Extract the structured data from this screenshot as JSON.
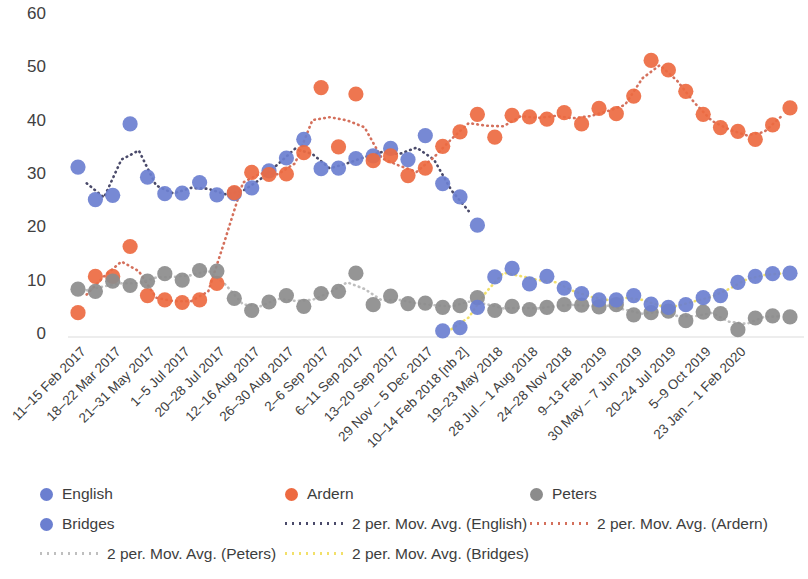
{
  "chart_data": {
    "type": "scatter",
    "title": "",
    "xlabel": "",
    "ylabel": "",
    "ylim": [
      0,
      60
    ],
    "ytick_values": [
      0,
      10,
      20,
      30,
      40,
      50,
      60
    ],
    "grid": false,
    "legend_position": "bottom",
    "categories": [
      "11–15 Feb 2017",
      "18–22 Mar 2017",
      "21–31 May 2017",
      "1–5 Jul 2017",
      "20–28 Jul 2017",
      "12–16 Aug 2017",
      "26–30 Aug 2017",
      "2–6 Sep 2017",
      "6–11 Sep 2017",
      "13–20 Sep 2017",
      "29 Nov – 5 Dec 2017",
      "10–14 Feb 2018 [nb 2]",
      "19–23 May 2018",
      "28 Jul – 1 Aug 2018",
      "24–28 Nov 2018",
      "9–13 Feb 2019",
      "30 May – 7 Jun 2019",
      "20–24 Jul 2019",
      "5–9 Oct 2019",
      "23 Jan – 1 Feb 2020"
    ],
    "category_tick_index": [
      0,
      2,
      4,
      6,
      8,
      10,
      12,
      14,
      16,
      18,
      20,
      22,
      24,
      26,
      28,
      30,
      32,
      34,
      36,
      38
    ],
    "series": [
      {
        "name": "English",
        "color": "#6B7FD0",
        "marker": "circle",
        "points": [
          {
            "i": 0,
            "y": 31.3
          },
          {
            "i": 1,
            "y": 25.2
          },
          {
            "i": 2,
            "y": 26.0
          },
          {
            "i": 3,
            "y": 39.4
          },
          {
            "i": 4,
            "y": 29.4
          },
          {
            "i": 5,
            "y": 26.3
          },
          {
            "i": 6,
            "y": 26.4
          },
          {
            "i": 7,
            "y": 28.4
          },
          {
            "i": 8,
            "y": 26.1
          },
          {
            "i": 9,
            "y": 26.3
          },
          {
            "i": 10,
            "y": 27.4
          },
          {
            "i": 11,
            "y": 30.6
          },
          {
            "i": 12,
            "y": 33.0
          },
          {
            "i": 13,
            "y": 36.5
          },
          {
            "i": 14,
            "y": 31.0
          },
          {
            "i": 15,
            "y": 31.1
          },
          {
            "i": 16,
            "y": 32.9
          },
          {
            "i": 17,
            "y": 33.4
          },
          {
            "i": 18,
            "y": 34.8
          },
          {
            "i": 19,
            "y": 32.7
          },
          {
            "i": 20,
            "y": 37.2
          },
          {
            "i": 21,
            "y": 28.2
          },
          {
            "i": 22,
            "y": 25.7
          },
          {
            "i": 23,
            "y": 20.4
          }
        ]
      },
      {
        "name": "Ardern",
        "color": "#ED6A41",
        "marker": "circle",
        "points": [
          {
            "i": 0,
            "y": 4.0
          },
          {
            "i": 1,
            "y": 10.8
          },
          {
            "i": 2,
            "y": 10.8
          },
          {
            "i": 3,
            "y": 16.4
          },
          {
            "i": 4,
            "y": 7.2
          },
          {
            "i": 5,
            "y": 6.4
          },
          {
            "i": 6,
            "y": 5.9
          },
          {
            "i": 7,
            "y": 6.4
          },
          {
            "i": 8,
            "y": 9.5
          },
          {
            "i": 9,
            "y": 26.5
          },
          {
            "i": 10,
            "y": 30.3
          },
          {
            "i": 11,
            "y": 29.9
          },
          {
            "i": 12,
            "y": 30.0
          },
          {
            "i": 13,
            "y": 34.0
          },
          {
            "i": 14,
            "y": 46.2
          },
          {
            "i": 15,
            "y": 35.1
          },
          {
            "i": 16,
            "y": 45.0
          },
          {
            "i": 17,
            "y": 32.5
          },
          {
            "i": 18,
            "y": 33.4
          },
          {
            "i": 19,
            "y": 29.7
          },
          {
            "i": 20,
            "y": 31.1
          },
          {
            "i": 21,
            "y": 35.2
          },
          {
            "i": 22,
            "y": 37.9
          },
          {
            "i": 23,
            "y": 41.2
          },
          {
            "i": 24,
            "y": 36.9
          },
          {
            "i": 25,
            "y": 41.0
          },
          {
            "i": 26,
            "y": 40.7
          },
          {
            "i": 27,
            "y": 40.3
          },
          {
            "i": 28,
            "y": 41.5
          },
          {
            "i": 29,
            "y": 39.4
          },
          {
            "i": 30,
            "y": 42.3
          },
          {
            "i": 31,
            "y": 41.3
          },
          {
            "i": 32,
            "y": 44.6
          },
          {
            "i": 33,
            "y": 51.3
          },
          {
            "i": 34,
            "y": 49.5
          },
          {
            "i": 35,
            "y": 45.5
          },
          {
            "i": 36,
            "y": 41.2
          },
          {
            "i": 37,
            "y": 38.7
          },
          {
            "i": 38,
            "y": 38.0
          },
          {
            "i": 39,
            "y": 36.5
          },
          {
            "i": 40,
            "y": 39.2
          },
          {
            "i": 41,
            "y": 42.4
          }
        ]
      },
      {
        "name": "Peters",
        "color": "#8C8C8C",
        "marker": "circle",
        "points": [
          {
            "i": 0,
            "y": 8.4
          },
          {
            "i": 1,
            "y": 8.0
          },
          {
            "i": 2,
            "y": 9.9
          },
          {
            "i": 3,
            "y": 9.1
          },
          {
            "i": 4,
            "y": 9.9
          },
          {
            "i": 5,
            "y": 11.3
          },
          {
            "i": 6,
            "y": 10.1
          },
          {
            "i": 7,
            "y": 11.9
          },
          {
            "i": 8,
            "y": 11.8
          },
          {
            "i": 9,
            "y": 6.7
          },
          {
            "i": 10,
            "y": 4.4
          },
          {
            "i": 11,
            "y": 6.0
          },
          {
            "i": 12,
            "y": 7.2
          },
          {
            "i": 13,
            "y": 5.2
          },
          {
            "i": 14,
            "y": 7.6
          },
          {
            "i": 15,
            "y": 8.0
          },
          {
            "i": 16,
            "y": 11.4
          },
          {
            "i": 17,
            "y": 5.5
          },
          {
            "i": 18,
            "y": 7.1
          },
          {
            "i": 19,
            "y": 5.7
          },
          {
            "i": 20,
            "y": 5.8
          },
          {
            "i": 21,
            "y": 5.0
          },
          {
            "i": 22,
            "y": 5.3
          },
          {
            "i": 23,
            "y": 6.8
          },
          {
            "i": 24,
            "y": 4.4
          },
          {
            "i": 25,
            "y": 5.2
          },
          {
            "i": 26,
            "y": 4.6
          },
          {
            "i": 27,
            "y": 5.0
          },
          {
            "i": 28,
            "y": 5.5
          },
          {
            "i": 29,
            "y": 5.4
          },
          {
            "i": 30,
            "y": 5.1
          },
          {
            "i": 31,
            "y": 5.5
          },
          {
            "i": 32,
            "y": 3.6
          },
          {
            "i": 33,
            "y": 4.0
          },
          {
            "i": 34,
            "y": 4.3
          },
          {
            "i": 35,
            "y": 2.5
          },
          {
            "i": 36,
            "y": 4.1
          },
          {
            "i": 37,
            "y": 3.8
          },
          {
            "i": 38,
            "y": 0.8
          },
          {
            "i": 39,
            "y": 3.0
          },
          {
            "i": 40,
            "y": 3.4
          },
          {
            "i": 41,
            "y": 3.2
          }
        ]
      },
      {
        "name": "Bridges",
        "color": "#6B7FD0",
        "marker": "circle",
        "points": [
          {
            "i": 21,
            "y": 0.6
          },
          {
            "i": 22,
            "y": 1.2
          },
          {
            "i": 23,
            "y": 5.0
          },
          {
            "i": 24,
            "y": 10.7
          },
          {
            "i": 25,
            "y": 12.3
          },
          {
            "i": 26,
            "y": 9.4
          },
          {
            "i": 27,
            "y": 10.8
          },
          {
            "i": 28,
            "y": 8.6
          },
          {
            "i": 29,
            "y": 7.6
          },
          {
            "i": 30,
            "y": 6.4
          },
          {
            "i": 31,
            "y": 6.4
          },
          {
            "i": 32,
            "y": 7.2
          },
          {
            "i": 33,
            "y": 5.6
          },
          {
            "i": 34,
            "y": 5.0
          },
          {
            "i": 35,
            "y": 5.5
          },
          {
            "i": 36,
            "y": 6.8
          },
          {
            "i": 37,
            "y": 7.2
          },
          {
            "i": 38,
            "y": 9.7
          },
          {
            "i": 39,
            "y": 10.8
          },
          {
            "i": 40,
            "y": 11.3
          },
          {
            "i": 41,
            "y": 11.4
          }
        ]
      }
    ],
    "trendlines": [
      {
        "name": "2 per. Mov. Avg. (English)",
        "color": "#4A4A6A",
        "style": "dotted",
        "of": "English"
      },
      {
        "name": "2 per. Mov. Avg. (Ardern)",
        "color": "#D4705C",
        "style": "dotted",
        "of": "Ardern"
      },
      {
        "name": "2 per. Mov. Avg. (Peters)",
        "color": "#BFBFBF",
        "style": "dotted",
        "of": "Peters"
      },
      {
        "name": "2 per. Mov. Avg. (Bridges)",
        "color": "#F2E06A",
        "style": "dotted",
        "of": "Bridges"
      }
    ]
  },
  "legend": {
    "items": [
      {
        "id": "english",
        "label": "English",
        "kind": "dot",
        "color": "#6B7FD0"
      },
      {
        "id": "ardern",
        "label": "Ardern",
        "kind": "dot",
        "color": "#ED6A41"
      },
      {
        "id": "peters",
        "label": "Peters",
        "kind": "dot",
        "color": "#8C8C8C"
      },
      {
        "id": "bridges",
        "label": "Bridges",
        "kind": "dot",
        "color": "#6B7FD0"
      },
      {
        "id": "avg-english",
        "label": "2 per. Mov. Avg. (English)",
        "kind": "line",
        "color": "#4A4A6A"
      },
      {
        "id": "avg-ardern",
        "label": "2 per. Mov. Avg. (Ardern)",
        "kind": "line",
        "color": "#D4705C"
      },
      {
        "id": "avg-peters",
        "label": "2 per. Mov. Avg. (Peters)",
        "kind": "line",
        "color": "#BFBFBF"
      },
      {
        "id": "avg-bridges",
        "label": "2 per. Mov. Avg. (Bridges)",
        "kind": "line",
        "color": "#F2E06A"
      }
    ]
  }
}
